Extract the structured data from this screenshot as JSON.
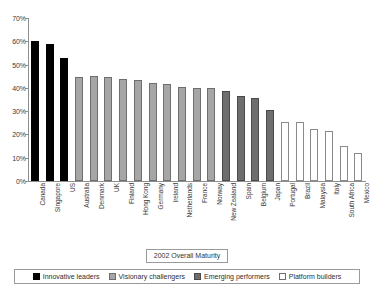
{
  "chart_data": {
    "type": "bar",
    "title": "",
    "subtitle": "",
    "xlabel": "2002 Overall Maturity",
    "ylabel": "",
    "ylim": [
      0,
      70
    ],
    "ytick_step": 10,
    "ytick_labels": [
      "70%",
      "60%",
      "50%",
      "40%",
      "30%",
      "20%",
      "10%",
      "0%"
    ],
    "ytick_values": [
      70,
      60,
      50,
      40,
      30,
      20,
      10,
      0
    ],
    "grid": false,
    "legend_position": "bottom",
    "categories": [
      "Canada",
      "Singapore",
      "US",
      "Australia",
      "Denmark",
      "UK",
      "Finland",
      "Hong Kong",
      "Germany",
      "Ireland",
      "Netherlands",
      "France",
      "Norway",
      "New Zealand",
      "Spain",
      "Belgium",
      "Japan",
      "Portugal",
      "Brazil",
      "Malaysia",
      "Italy",
      "South Africa",
      "Mexico"
    ],
    "values": [
      60.0,
      59.0,
      53.0,
      44.5,
      45.0,
      44.5,
      44.0,
      43.5,
      42.0,
      41.5,
      40.5,
      40.0,
      40.0,
      38.5,
      36.5,
      35.5,
      30.5,
      25.5,
      25.5,
      22.5,
      21.5,
      15.0,
      12.0
    ],
    "point_groups": [
      "innovative",
      "innovative",
      "innovative",
      "visionary",
      "visionary",
      "visionary",
      "visionary",
      "visionary",
      "visionary",
      "visionary",
      "visionary",
      "visionary",
      "visionary",
      "emerging",
      "emerging",
      "emerging",
      "emerging",
      "platform",
      "platform",
      "platform",
      "platform",
      "platform",
      "platform"
    ],
    "legend": [
      {
        "key": "innovative",
        "label": "Innovative leaders",
        "color": "#000000"
      },
      {
        "key": "visionary",
        "label": "Visionary challengers",
        "color": "#a6a6a6"
      },
      {
        "key": "emerging",
        "label": "Emerging performers",
        "color": "#6e6e6e"
      },
      {
        "key": "platform",
        "label": "Platform builders",
        "color": "#ffffff"
      }
    ]
  }
}
